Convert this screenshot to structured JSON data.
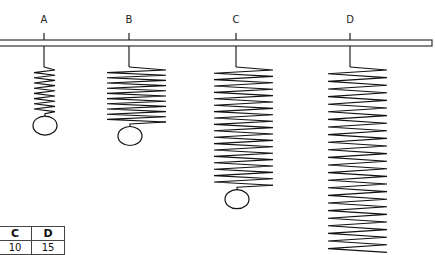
{
  "springs": [
    {
      "label": "A",
      "coils": 8,
      "mass": true
    },
    {
      "label": "B",
      "coils": 10,
      "mass": true
    },
    {
      "label": "C",
      "coils": 18,
      "mass": true
    },
    {
      "label": "D",
      "coils": 24,
      "mass": false
    }
  ],
  "table": {
    "headers": [
      "",
      "",
      "C",
      "D"
    ],
    "values": [
      "",
      "",
      "10",
      "15"
    ]
  }
}
